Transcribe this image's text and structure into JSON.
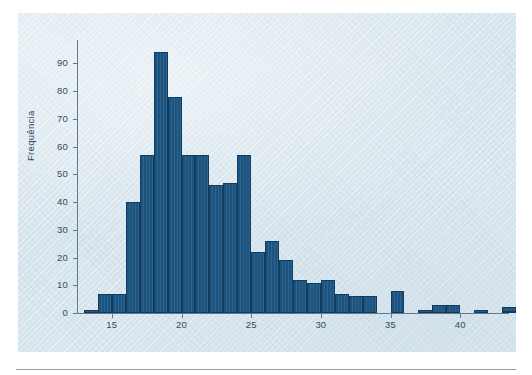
{
  "figure": {
    "background_color": "#dbe7ee",
    "bar_color": "#1b5480",
    "bar_edge_color": "#123c5e",
    "axis_color": "#5e7c90",
    "y_axis_title": "Frequência"
  },
  "chart_data": {
    "type": "bar",
    "title": "",
    "xlabel": "",
    "ylabel": "Frequência",
    "xlim": [
      12.5,
      43.5
    ],
    "ylim": [
      0,
      97
    ],
    "grid": false,
    "legend": null,
    "bin_width": 1,
    "y_ticks": [
      0,
      10,
      20,
      30,
      40,
      50,
      60,
      70,
      80,
      90
    ],
    "y_tick_labels": [
      "0",
      "10",
      "20",
      "30",
      "40",
      "50",
      "60",
      "70",
      "80",
      "90"
    ],
    "x_ticks": [
      15,
      20,
      25,
      30,
      35,
      40
    ],
    "x_tick_labels": [
      "15",
      "20",
      "25",
      "30",
      "35",
      "40"
    ],
    "categories": [
      "13",
      "14",
      "15",
      "16",
      "17",
      "18",
      "19",
      "20",
      "21",
      "22",
      "23",
      "24",
      "25",
      "26",
      "27",
      "28",
      "29",
      "30",
      "31",
      "32",
      "33",
      "34",
      "35",
      "36",
      "37",
      "38",
      "39",
      "40",
      "41",
      "42",
      "43"
    ],
    "bin_left_edges": [
      13,
      14,
      15,
      16,
      17,
      18,
      19,
      20,
      21,
      22,
      23,
      24,
      25,
      26,
      27,
      28,
      29,
      30,
      31,
      32,
      33,
      34,
      35,
      36,
      37,
      38,
      39,
      40,
      41,
      42,
      43
    ],
    "values": [
      1,
      7,
      7,
      40,
      57,
      94,
      78,
      57,
      57,
      46,
      47,
      57,
      22,
      26,
      19,
      12,
      11,
      12,
      7,
      6,
      6,
      0,
      8,
      0,
      1,
      3,
      3,
      0,
      1,
      0,
      2
    ],
    "extra_values": [
      {
        "bin_left_edge": 43,
        "value": 0.6
      }
    ]
  }
}
